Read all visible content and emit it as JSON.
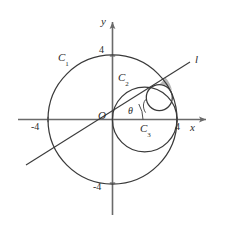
{
  "figure": {
    "kind": "geometry-diagram",
    "background_color": "#ffffff",
    "stroke_color": "#3a3a3a",
    "axis_color": "#5a5a5a",
    "shaded_region_color": "#9a9a9a"
  },
  "axes": {
    "x_label": "x",
    "y_label": "y",
    "origin_label": "O",
    "x_ticks": [
      {
        "label": "-4",
        "value": -4
      },
      {
        "label": "4",
        "value": 4
      }
    ],
    "y_ticks": [
      {
        "label": "4",
        "value": 4
      },
      {
        "label": "-4",
        "value": -4
      }
    ]
  },
  "curves": [
    {
      "name": "C1",
      "label": "C",
      "subscript": "1",
      "role": "outer-circle",
      "center": [
        0,
        0
      ],
      "radius": 4
    },
    {
      "name": "C2",
      "label": "C",
      "subscript": "2",
      "role": "middle-circle",
      "center": [
        2,
        0
      ],
      "radius": 2
    },
    {
      "name": "C3",
      "label": "C",
      "subscript": "3",
      "role": "small-circle",
      "center": [
        3.2,
        1.3
      ],
      "radius": 0.8
    }
  ],
  "line": {
    "name": "l",
    "label": "l",
    "role": "ray-through-origin",
    "through": [
      0,
      0
    ]
  },
  "angle": {
    "label": "θ",
    "vertex": "O",
    "from": "positive x-axis",
    "to": "line l"
  },
  "shaded_region": {
    "present": true,
    "description": "small curvilinear region bounded by C1, C3 and line l"
  }
}
